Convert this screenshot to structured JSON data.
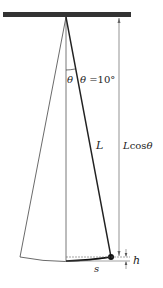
{
  "diagram": {
    "type": "pendulum",
    "labels": {
      "theta_small": "θ",
      "theta_eq_prefix": "θ",
      "theta_eq_value": " =10°",
      "length": "L",
      "length_cos_prefix": "L",
      "length_cos_func": "cos",
      "length_cos_suffix": "θ",
      "arc": "s",
      "height": "h"
    },
    "colors": {
      "ceiling": "#333333",
      "string": "#222222",
      "bob": "#111111",
      "dimension": "#666666",
      "ghost_string": "#444444"
    }
  }
}
